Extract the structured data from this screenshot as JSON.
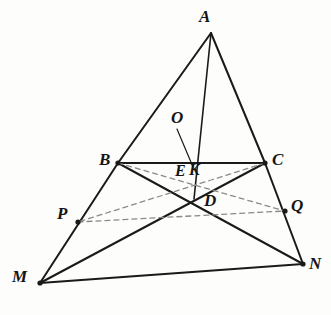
{
  "figure": {
    "type": "geometry-diagram",
    "canvas": {
      "width": 331,
      "height": 315
    },
    "colors": {
      "background": "#fdfdfc",
      "stroke_solid": "#1a1a1a",
      "stroke_dashed": "#8a8a8a",
      "label": "#141414"
    }
  },
  "points": [
    {
      "id": "A",
      "label": "A",
      "x": 211,
      "y": 33,
      "label_x": 199,
      "label_y": 8,
      "dot": false,
      "size": "lbl-lg"
    },
    {
      "id": "B",
      "label": "B",
      "x": 118,
      "y": 163,
      "label_x": 99,
      "label_y": 151,
      "dot": true,
      "size": "lbl-lg"
    },
    {
      "id": "C",
      "label": "C",
      "x": 265,
      "y": 163,
      "label_x": 272,
      "label_y": 151,
      "dot": true,
      "size": "lbl-lg"
    },
    {
      "id": "M",
      "label": "M",
      "x": 40,
      "y": 283,
      "label_x": 12,
      "label_y": 268,
      "dot": true,
      "size": "lbl-lg"
    },
    {
      "id": "N",
      "label": "N",
      "x": 303,
      "y": 264,
      "label_x": 309,
      "label_y": 255,
      "dot": true,
      "size": "lbl-lg"
    },
    {
      "id": "P",
      "label": "P",
      "x": 78,
      "y": 222,
      "label_x": 57,
      "label_y": 205,
      "dot": true,
      "size": "lbl-lg"
    },
    {
      "id": "Q",
      "label": "Q",
      "x": 285,
      "y": 211,
      "label_x": 291,
      "label_y": 197,
      "dot": true,
      "size": "lbl-lg"
    },
    {
      "id": "D",
      "label": "D",
      "x": 194,
      "y": 199,
      "label_x": 204,
      "label_y": 192,
      "dot": false,
      "size": "lbl-lg"
    },
    {
      "id": "E",
      "label": "E",
      "x": 185,
      "y": 171,
      "label_x": 175,
      "label_y": 163,
      "dot": false,
      "size": "lbl-md"
    },
    {
      "id": "K",
      "label": "K",
      "x": 197,
      "y": 171,
      "label_x": 189,
      "label_y": 162,
      "dot": false,
      "size": "lbl-md"
    },
    {
      "id": "O",
      "label": "O",
      "x": 178,
      "y": 120,
      "label_x": 171,
      "label_y": 109,
      "dot": false,
      "size": "lbl-lg"
    }
  ],
  "segments": [
    {
      "id": "AB",
      "from": "A",
      "to": "B",
      "style": "solid",
      "width": 2.0
    },
    {
      "id": "AC",
      "from": "A",
      "to": "C",
      "style": "solid",
      "width": 2.0
    },
    {
      "id": "BC",
      "from": "B",
      "to": "C",
      "style": "solid",
      "width": 2.0
    },
    {
      "id": "AD",
      "from": "A",
      "to": "D",
      "style": "solid",
      "width": 1.6
    },
    {
      "id": "BM",
      "from": "B",
      "to": "M",
      "style": "solid",
      "width": 2.0
    },
    {
      "id": "CN",
      "from": "C",
      "to": "N",
      "style": "solid",
      "width": 2.0
    },
    {
      "id": "MN",
      "from": "M",
      "to": "N",
      "style": "solid",
      "width": 2.0
    },
    {
      "id": "BN",
      "from": "B",
      "to": "N",
      "style": "solid",
      "width": 2.0
    },
    {
      "id": "CM",
      "from": "C",
      "to": "M",
      "style": "solid",
      "width": 2.0
    },
    {
      "id": "BQ",
      "from": "B",
      "to": "Q",
      "style": "dashed",
      "width": 1.3
    },
    {
      "id": "CP",
      "from": "C",
      "to": "P",
      "style": "dashed",
      "width": 1.3
    },
    {
      "id": "PQ",
      "from": "P",
      "to": "Q",
      "style": "dashed",
      "width": 1.3
    }
  ],
  "leaders": [
    {
      "id": "O-leader",
      "x1": 177,
      "y1": 129,
      "x2": 193,
      "y2": 167,
      "width": 1.2
    }
  ]
}
